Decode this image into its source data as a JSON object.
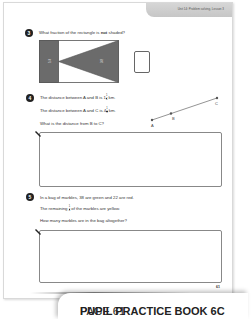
{
  "header": {
    "tab_text": "Unit 14: Problem solving, Lesson 3"
  },
  "questions": [
    {
      "number": "3",
      "text_before": "What fraction of the rectangle is ",
      "text_bold": "not",
      "text_after": " shaded?",
      "diagram": {
        "left_label": "1/4",
        "triangle_label": "3/8"
      }
    },
    {
      "number": "4",
      "line1_before": "The distance between A and B is 1",
      "line1_frac_n": "1",
      "line1_frac_d": "4",
      "line1_after": " km.",
      "line2_before": "The distance between A and C is 4",
      "line2_frac_n": "1",
      "line2_frac_d": "3",
      "line2_after": " km.",
      "line3": "What is the distance from B to C?",
      "points": [
        "A",
        "B",
        "C"
      ]
    },
    {
      "number": "5",
      "line1": "In a bag of marbles, 38 are green and 22 are red.",
      "line2_before": "The remaining ",
      "line2_frac_n": "1",
      "line2_frac_d": "4",
      "line2_after": " of the marbles are yellow.",
      "line3": "How many marbles are in the bag altogether?"
    }
  ],
  "page_number": "61",
  "footer": {
    "book": "PUPIL PRACTICE BOOK 6C",
    "page": "PAGE 61"
  }
}
